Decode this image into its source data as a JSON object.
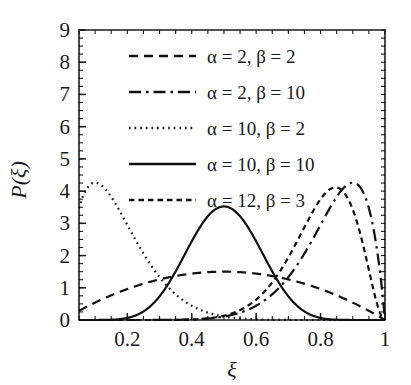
{
  "chart_data": {
    "type": "line",
    "title": "",
    "xlabel": "ξ",
    "ylabel": "P(ξ)",
    "xlim": [
      0.05,
      1.0
    ],
    "ylim": [
      0,
      9
    ],
    "grid": false,
    "legend_position": "upper-center",
    "x_ticks": [
      {
        "value": 0.2,
        "label": "0.2"
      },
      {
        "value": 0.4,
        "label": "0.4"
      },
      {
        "value": 0.6,
        "label": "0.6"
      },
      {
        "value": 0.8,
        "label": "0.8"
      },
      {
        "value": 1.0,
        "label": "1"
      }
    ],
    "x_minor_step": 0.05,
    "y_ticks": [
      {
        "value": 0,
        "label": "0"
      },
      {
        "value": 1,
        "label": "1"
      },
      {
        "value": 2,
        "label": "2"
      },
      {
        "value": 3,
        "label": "3"
      },
      {
        "value": 4,
        "label": "4"
      },
      {
        "value": 5,
        "label": "5"
      },
      {
        "value": 6,
        "label": "6"
      },
      {
        "value": 7,
        "label": "7"
      },
      {
        "value": 8,
        "label": "8"
      },
      {
        "value": 9,
        "label": "9"
      }
    ],
    "y_minor_step": 0.25,
    "distribution": "beta",
    "series": [
      {
        "name": "α = 2, β = 2",
        "alpha": 2,
        "beta": 2,
        "style": "dashed",
        "dasharray": "9,6",
        "peak": {
          "x": 0.5,
          "y": 1.5
        }
      },
      {
        "name": "α = 2, β = 10",
        "alpha": 2,
        "beta": 10,
        "style": "dash-dot",
        "dasharray": "12,5,2.5,5",
        "peak": {
          "x": 0.95,
          "y": 6.3
        },
        "note": "rendered mirrored: rises steeply toward ξ = 0.95"
      },
      {
        "name": "α = 10, β = 2",
        "alpha": 10,
        "beta": 2,
        "style": "dotted",
        "dasharray": "1.6,4",
        "peak": {
          "x": 0.05,
          "y": 6.3
        },
        "note": "rendered mirrored: decays steeply from ξ = 0.05"
      },
      {
        "name": "α = 10, β = 10",
        "alpha": 10,
        "beta": 10,
        "style": "solid",
        "dasharray": "",
        "peak": {
          "x": 0.5,
          "y": 3.5
        }
      },
      {
        "name": "α = 12, β = 3",
        "alpha": 12,
        "beta": 3,
        "style": "short-dashed",
        "dasharray": "5.5,4",
        "peak": {
          "x": 0.85,
          "y": 4.1
        }
      }
    ]
  }
}
